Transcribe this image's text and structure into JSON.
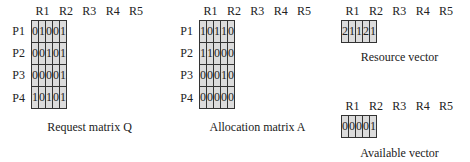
{
  "columns": [
    "R1",
    "R2",
    "R3",
    "R4",
    "R5"
  ],
  "rows": [
    "P1",
    "P2",
    "P3",
    "P4"
  ],
  "request_matrix": {
    "caption": "Request matrix Q",
    "values": [
      [
        0,
        1,
        0,
        0,
        1
      ],
      [
        0,
        0,
        1,
        0,
        1
      ],
      [
        0,
        0,
        0,
        0,
        1
      ],
      [
        1,
        0,
        1,
        0,
        1
      ]
    ]
  },
  "allocation_matrix": {
    "caption": "Allocation matrix A",
    "values": [
      [
        1,
        0,
        1,
        1,
        0
      ],
      [
        1,
        1,
        0,
        0,
        0
      ],
      [
        0,
        0,
        0,
        1,
        0
      ],
      [
        0,
        0,
        0,
        0,
        0
      ]
    ]
  },
  "resource_vector": {
    "caption": "Resource vector",
    "values": [
      2,
      1,
      1,
      2,
      1
    ]
  },
  "available_vector": {
    "caption": "Available vector",
    "values": [
      0,
      0,
      0,
      0,
      1
    ]
  }
}
